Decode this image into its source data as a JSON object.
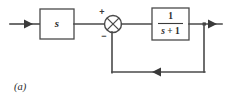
{
  "figure": {
    "caption": "(a)",
    "type": "control-system-block-diagram"
  },
  "blocks": [
    {
      "id": "gain-block",
      "name": "derivative-block",
      "label": "s"
    },
    {
      "id": "plant-block",
      "name": "first-order-lag-block",
      "numerator": "1",
      "denominator_var": "s",
      "denominator_op": " + ",
      "denominator_const": "1"
    }
  ],
  "summing_junction": {
    "name": "summing-junction",
    "positive_sign": "+",
    "negative_sign": "−"
  },
  "signals": {
    "input_arrow": "input-signal",
    "output_arrow": "output-signal",
    "feedback_arrow": "feedback-signal"
  }
}
